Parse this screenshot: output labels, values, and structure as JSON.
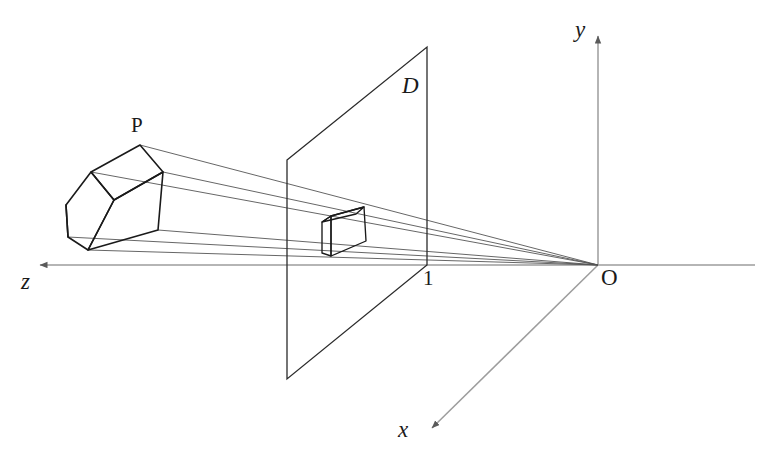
{
  "figure": {
    "labels": {
      "y_axis": "y",
      "x_axis": "x",
      "z_axis": "z",
      "origin": "O",
      "image_plane": "D",
      "object": "P",
      "focal_distance": "1"
    },
    "colors": {
      "axis": "#9a9a9a",
      "ray": "#555555",
      "object_edge": "#1a1a1a",
      "plane_edge": "#2b2b2b",
      "label": "#1a1a1a",
      "background": "#ffffff"
    },
    "geometry": {
      "origin": [
        598,
        265
      ],
      "y_axis_tip": [
        598,
        30
      ],
      "x_axis_tip": [
        427,
        432
      ],
      "z_axis_tip": [
        34,
        265
      ],
      "z_axis_right_end": [
        755,
        265
      ],
      "plane_corners": [
        [
          287,
          160
        ],
        [
          427,
          47
        ],
        [
          427,
          265
        ],
        [
          287,
          379
        ]
      ],
      "object_vertices": {
        "top_back": [
          140,
          145
        ],
        "top_right": [
          163,
          172
        ],
        "top_left": [
          91,
          172
        ],
        "bottom_right": [
          158,
          230
        ],
        "bottom_front": [
          88,
          250
        ],
        "bottom_left": [
          68,
          237
        ],
        "back_left_lower": [
          66,
          205
        ],
        "front_mid": [
          114,
          200
        ]
      },
      "image_vertices": {
        "top_back": [
          364,
          207
        ],
        "top_right": [
          374,
          215
        ],
        "top_left": [
          331,
          216
        ],
        "bottom_right": [
          366,
          241
        ],
        "bottom_front": [
          331,
          256
        ],
        "bottom_left": [
          322,
          253
        ],
        "left_upper": [
          322,
          222
        ]
      },
      "ray_endpoints": [
        [
          140,
          145
        ],
        [
          163,
          172
        ],
        [
          91,
          172
        ],
        [
          158,
          230
        ],
        [
          88,
          250
        ],
        [
          68,
          237
        ]
      ]
    }
  }
}
